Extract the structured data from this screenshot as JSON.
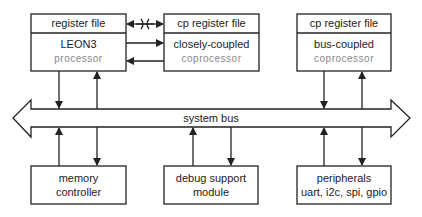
{
  "diagram": {
    "top_row": [
      {
        "header": "register file",
        "title": "LEON3",
        "subtitle": "processor"
      },
      {
        "header": "cp register file",
        "title": "closely-coupled",
        "subtitle": "coprocessor"
      },
      {
        "header": "cp register file",
        "title": "bus-coupled",
        "subtitle": "coprocessor"
      }
    ],
    "bus": {
      "label": "system bus"
    },
    "bottom_row": [
      {
        "line1": "memory",
        "line2": "controller"
      },
      {
        "line1": "debug support",
        "line2": "module"
      },
      {
        "line1": "peripherals",
        "line2": "uart, i2c, spi, gpio"
      }
    ],
    "connections": [
      {
        "from": "register file",
        "to": "cp register file (closely-coupled)",
        "type": "bidirectional",
        "marked": "crossed"
      },
      {
        "from": "LEON3 processor",
        "to": "closely-coupled coprocessor",
        "type": "unidirectional"
      },
      {
        "from": "closely-coupled coprocessor",
        "to": "LEON3 processor",
        "type": "unidirectional"
      },
      {
        "from": "LEON3 processor",
        "to": "system bus",
        "type": "bidirectional"
      },
      {
        "from": "bus-coupled coprocessor",
        "to": "system bus",
        "type": "bidirectional"
      },
      {
        "from": "memory controller",
        "to": "system bus",
        "type": "bidirectional"
      },
      {
        "from": "debug support module",
        "to": "system bus",
        "type": "bidirectional"
      },
      {
        "from": "peripherals",
        "to": "system bus",
        "type": "bidirectional"
      }
    ],
    "colors": {
      "stroke": "#222222",
      "background": "#ffffff"
    }
  }
}
